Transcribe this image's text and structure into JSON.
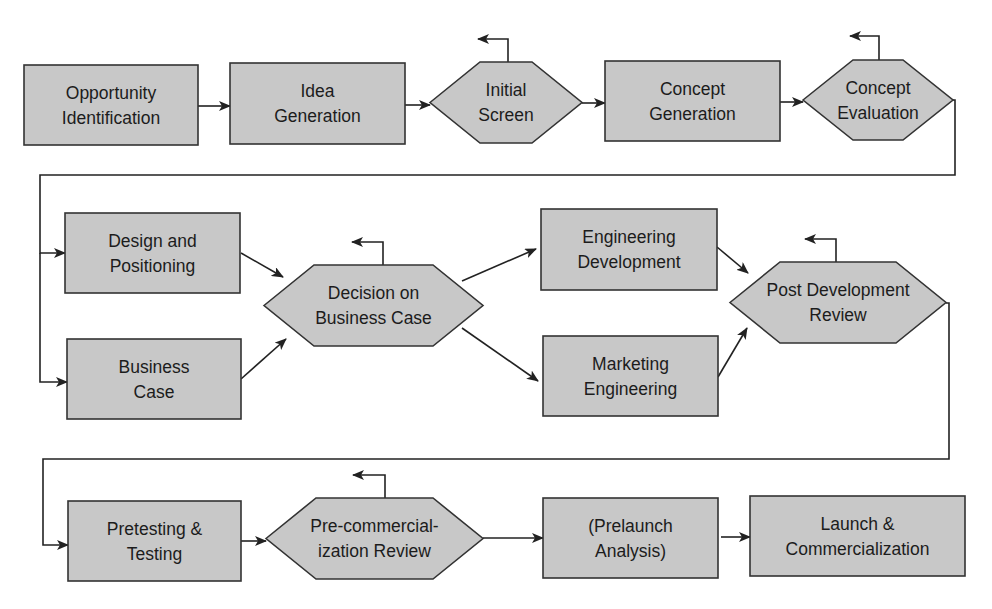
{
  "diagram": {
    "type": "flowchart",
    "colors": {
      "node_fill": "#c8c8c8",
      "node_stroke": "#333333",
      "line": "#222222",
      "text": "#1c1c1c",
      "background": "#ffffff"
    },
    "nodes": [
      {
        "id": "opportunity-identification",
        "shape": "rect",
        "lines": [
          "Opportunity",
          "Identification"
        ],
        "x": 24,
        "y": 65,
        "w": 174,
        "h": 80
      },
      {
        "id": "idea-generation",
        "shape": "rect",
        "lines": [
          "Idea",
          "Generation"
        ],
        "x": 230,
        "y": 63,
        "w": 175,
        "h": 81
      },
      {
        "id": "initial-screen",
        "shape": "hex",
        "lines": [
          "Initial",
          "Screen"
        ],
        "x": 430,
        "y": 62,
        "w": 152,
        "h": 81
      },
      {
        "id": "concept-generation",
        "shape": "rect",
        "lines": [
          "Concept",
          "Generation"
        ],
        "x": 605,
        "y": 61,
        "w": 175,
        "h": 80
      },
      {
        "id": "concept-evaluation",
        "shape": "hex",
        "lines": [
          "Concept",
          "Evaluation"
        ],
        "x": 803,
        "y": 60,
        "w": 150,
        "h": 80
      },
      {
        "id": "design-and-positioning",
        "shape": "rect",
        "lines": [
          "Design and",
          "Positioning"
        ],
        "x": 65,
        "y": 213,
        "w": 175,
        "h": 80
      },
      {
        "id": "business-case",
        "shape": "rect",
        "lines": [
          "Business",
          "Case"
        ],
        "x": 67,
        "y": 339,
        "w": 174,
        "h": 80
      },
      {
        "id": "decision-on-business-case",
        "shape": "hex",
        "lines": [
          "Decision on",
          "Business Case"
        ],
        "x": 264,
        "y": 265,
        "w": 219,
        "h": 81
      },
      {
        "id": "engineering-development",
        "shape": "rect",
        "lines": [
          "Engineering",
          "Development"
        ],
        "x": 541,
        "y": 209,
        "w": 176,
        "h": 81
      },
      {
        "id": "marketing-engineering",
        "shape": "rect",
        "lines": [
          "Marketing",
          "Engineering"
        ],
        "x": 543,
        "y": 336,
        "w": 175,
        "h": 80
      },
      {
        "id": "post-development-review",
        "shape": "hex",
        "lines": [
          "Post Development",
          "Review"
        ],
        "x": 730,
        "y": 262,
        "w": 216,
        "h": 81
      },
      {
        "id": "pretesting-and-testing",
        "shape": "rect",
        "lines": [
          "Pretesting &",
          "Testing"
        ],
        "x": 68,
        "y": 501,
        "w": 173,
        "h": 80
      },
      {
        "id": "pre-commercialization-review",
        "shape": "hex",
        "lines": [
          "Pre-commercial-",
          "ization Review"
        ],
        "x": 266,
        "y": 498,
        "w": 217,
        "h": 81
      },
      {
        "id": "prelaunch-analysis",
        "shape": "rect",
        "lines": [
          "(Prelaunch",
          "Analysis)"
        ],
        "x": 543,
        "y": 498,
        "w": 175,
        "h": 80
      },
      {
        "id": "launch-and-commercialization",
        "shape": "rect",
        "lines": [
          "Launch &",
          "Commercialization"
        ],
        "x": 750,
        "y": 496,
        "w": 215,
        "h": 80
      }
    ],
    "edges": [
      {
        "from": "opportunity-identification",
        "to": "idea-generation",
        "points": [
          [
            198,
            106
          ],
          [
            230,
            106
          ]
        ]
      },
      {
        "from": "idea-generation",
        "to": "initial-screen",
        "points": [
          [
            405,
            105
          ],
          [
            430,
            105
          ]
        ]
      },
      {
        "from": "initial-screen",
        "to": "concept-generation",
        "points": [
          [
            582,
            103
          ],
          [
            605,
            103
          ]
        ]
      },
      {
        "from": "concept-generation",
        "to": "concept-evaluation",
        "points": [
          [
            780,
            102
          ],
          [
            803,
            102
          ]
        ]
      },
      {
        "from": "concept-evaluation",
        "to": "design-and-positioning",
        "points": [
          [
            953,
            100
          ],
          [
            955,
            100
          ],
          [
            955,
            175
          ],
          [
            40,
            175
          ],
          [
            40,
            253
          ],
          [
            65,
            253
          ]
        ]
      },
      {
        "from": "concept-evaluation",
        "to": "business-case",
        "points": [
          [
            40,
            253
          ],
          [
            40,
            382
          ],
          [
            67,
            382
          ]
        ]
      },
      {
        "from": "design-and-positioning",
        "to": "decision-on-business-case",
        "points": [
          [
            241,
            253
          ],
          [
            283,
            277
          ]
        ]
      },
      {
        "from": "business-case",
        "to": "decision-on-business-case",
        "points": [
          [
            241,
            379
          ],
          [
            286,
            339
          ]
        ]
      },
      {
        "from": "decision-on-business-case",
        "to": "engineering-development",
        "points": [
          [
            462,
            281
          ],
          [
            536,
            249
          ]
        ]
      },
      {
        "from": "decision-on-business-case",
        "to": "marketing-engineering",
        "points": [
          [
            462,
            328
          ],
          [
            538,
            381
          ]
        ]
      },
      {
        "from": "engineering-development",
        "to": "post-development-review",
        "points": [
          [
            717,
            247
          ],
          [
            748,
            273
          ]
        ]
      },
      {
        "from": "marketing-engineering",
        "to": "post-development-review",
        "points": [
          [
            718,
            377
          ],
          [
            747,
            328
          ]
        ]
      },
      {
        "from": "post-development-review",
        "to": "pretesting-and-testing",
        "points": [
          [
            946,
            303
          ],
          [
            949,
            303
          ],
          [
            949,
            459
          ],
          [
            43,
            459
          ],
          [
            43,
            545
          ],
          [
            68,
            545
          ]
        ]
      },
      {
        "from": "pretesting-and-testing",
        "to": "pre-commercialization-review",
        "points": [
          [
            241,
            541
          ],
          [
            266,
            541
          ]
        ]
      },
      {
        "from": "pre-commercialization-review",
        "to": "prelaunch-analysis",
        "points": [
          [
            483,
            538
          ],
          [
            543,
            538
          ]
        ]
      },
      {
        "from": "prelaunch-analysis",
        "to": "launch-and-commercialization",
        "points": [
          [
            721,
            537
          ],
          [
            750,
            537
          ]
        ]
      }
    ],
    "exit_arrows": [
      {
        "node": "initial-screen",
        "points": [
          [
            508,
            62
          ],
          [
            508,
            39
          ],
          [
            478,
            39
          ]
        ]
      },
      {
        "node": "concept-evaluation",
        "points": [
          [
            879,
            60
          ],
          [
            879,
            36
          ],
          [
            850,
            36
          ]
        ]
      },
      {
        "node": "decision-on-business-case",
        "points": [
          [
            383,
            265
          ],
          [
            383,
            242
          ],
          [
            352,
            242
          ]
        ]
      },
      {
        "node": "post-development-review",
        "points": [
          [
            836,
            262
          ],
          [
            836,
            239
          ],
          [
            805,
            239
          ]
        ]
      },
      {
        "node": "pre-commercialization-review",
        "points": [
          [
            385,
            498
          ],
          [
            385,
            475
          ],
          [
            353,
            475
          ]
        ]
      }
    ]
  }
}
